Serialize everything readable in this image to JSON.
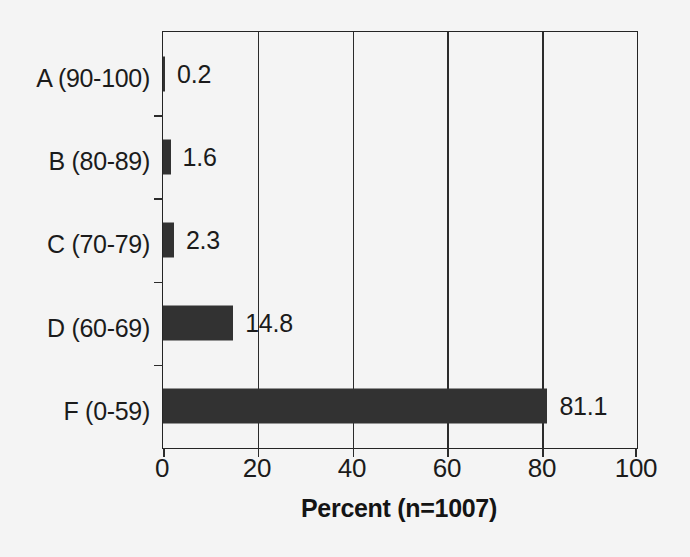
{
  "chart_data": {
    "type": "bar",
    "orientation": "horizontal",
    "title": "",
    "xlabel": "Percent (n=1007)",
    "ylabel": "",
    "categories": [
      "A (90-100)",
      "B (80-89)",
      "C (70-79)",
      "D (60-69)",
      "F (0-59)"
    ],
    "values": [
      0.2,
      1.6,
      2.3,
      14.8,
      81.1
    ],
    "value_labels": [
      "0.2",
      "1.6",
      "2.3",
      "14.8",
      "81.1"
    ],
    "xlim": [
      0,
      100
    ],
    "xticks": [
      0,
      20,
      40,
      60,
      80,
      100
    ],
    "xtick_labels": [
      "0",
      "20",
      "40",
      "60",
      "80",
      "100"
    ],
    "grid": true,
    "grid_axis": "x",
    "legend": null,
    "sample_size": 1007,
    "bar_color": "#323232",
    "axis_color": "#242424",
    "background_color": "#f4f4f4",
    "text_color": "#1b1b1b"
  },
  "axis": {
    "x_title": "Percent (n=1007)"
  }
}
